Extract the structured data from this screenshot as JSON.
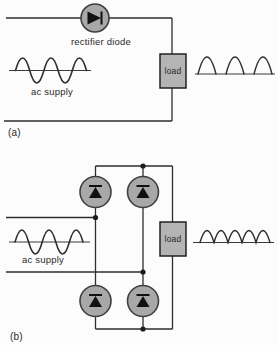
{
  "colors": {
    "background": "#fcfcfc",
    "line": "#2e2e2e",
    "diode_fill": "#a8a8a8",
    "load_fill": "#b4b4b4",
    "text": "#2a2a2a"
  },
  "figure_a": {
    "panel_label": "(a)",
    "circuit": "half-wave rectifier: single diode in series with load",
    "diode_label": "rectifier diode",
    "ac_supply_label": "ac supply",
    "load_label": "load",
    "input_waveform": "ac sine wave, 2.5 cycles (3 positive peaks)",
    "output_waveform": "half-wave rectified: 3 separated positive humps"
  },
  "figure_b": {
    "panel_label": "(b)",
    "circuit": "full-wave bridge rectifier: four diodes, load in series rail",
    "ac_supply_label": "ac supply",
    "load_label": "load",
    "input_waveform": "ac sine wave, 2.5 cycles (3 positive peaks)",
    "output_waveform": "full-wave rectified: 5 adjacent positive humps"
  }
}
